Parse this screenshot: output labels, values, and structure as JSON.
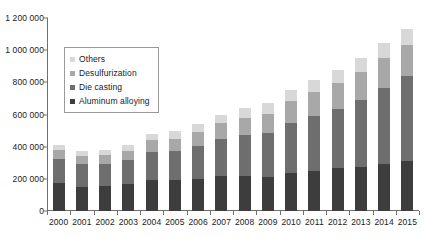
{
  "chart_data": {
    "type": "bar",
    "stacked": true,
    "title": "",
    "subtitle": "",
    "xlabel": "",
    "ylabel": "",
    "ylim": [
      0,
      1200000
    ],
    "ytick_values": [
      0,
      200000,
      400000,
      600000,
      800000,
      1000000,
      1200000
    ],
    "ytick_labels": [
      "0",
      "200 000",
      "400 000",
      "600 000",
      "800 000",
      "1 000 000",
      "1 200 000"
    ],
    "grid": false,
    "legend_position": "upper-left-inside",
    "categories": [
      "2000",
      "2001",
      "2002",
      "2003",
      "2004",
      "2005",
      "2006",
      "2007",
      "2008",
      "2009",
      "2010",
      "2011",
      "2012",
      "2013",
      "2014",
      "2015"
    ],
    "series": [
      {
        "name": "Aluminum alloying",
        "color": "#3d3d3d",
        "stack_order": 1,
        "values": [
          175000,
          150000,
          155000,
          165000,
          195000,
          195000,
          200000,
          215000,
          215000,
          210000,
          235000,
          250000,
          265000,
          275000,
          295000,
          310000
        ]
      },
      {
        "name": "Die casting",
        "color": "#6e6e6e",
        "stack_order": 2,
        "values": [
          150000,
          140000,
          140000,
          150000,
          175000,
          180000,
          205000,
          230000,
          255000,
          275000,
          310000,
          340000,
          370000,
          415000,
          470000,
          530000
        ]
      },
      {
        "name": "Desulfurization",
        "color": "#a8a8a8",
        "stack_order": 3,
        "values": [
          55000,
          55000,
          55000,
          60000,
          70000,
          75000,
          85000,
          100000,
          110000,
          120000,
          140000,
          150000,
          160000,
          175000,
          185000,
          190000
        ]
      },
      {
        "name": "Others",
        "color": "#d8d8d8",
        "stack_order": 4,
        "values": [
          30000,
          30000,
          30000,
          35000,
          40000,
          45000,
          50000,
          55000,
          60000,
          65000,
          70000,
          75000,
          80000,
          85000,
          95000,
          100000
        ]
      }
    ],
    "totals": [
      410000,
      375000,
      380000,
      410000,
      480000,
      495000,
      540000,
      600000,
      640000,
      670000,
      755000,
      815000,
      875000,
      950000,
      1045000,
      1130000
    ]
  },
  "legend": {
    "items": [
      {
        "label": "Others",
        "color": "#d8d8d8"
      },
      {
        "label": "Desulfurization",
        "color": "#a8a8a8"
      },
      {
        "label": "Die casting",
        "color": "#6e6e6e"
      },
      {
        "label": "Aluminum alloying",
        "color": "#3d3d3d"
      }
    ]
  },
  "colors": {
    "axis": "#6e6e6e",
    "text": "#1a1a1a",
    "background": "#ffffff",
    "legend_border": "#9a9a9a"
  }
}
